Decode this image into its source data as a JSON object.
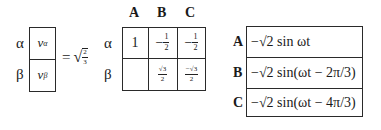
{
  "left_vector": {
    "row_labels": [
      "α",
      "β"
    ],
    "entries": [
      {
        "symbol": "v",
        "subscript": "α"
      },
      {
        "symbol": "v",
        "subscript": "β"
      }
    ]
  },
  "equals_sign": "=",
  "coefficient": {
    "radical": "√",
    "numerator": "2",
    "denominator": "3"
  },
  "transform_matrix": {
    "column_headers": [
      "A",
      "B",
      "C"
    ],
    "row_labels": [
      "α",
      "β"
    ],
    "rows": [
      [
        {
          "type": "text",
          "value": "1"
        },
        {
          "type": "frac",
          "sign": "−",
          "numerator": "1",
          "denominator": "2"
        },
        {
          "type": "frac",
          "sign": "−",
          "numerator": "1",
          "denominator": "2"
        }
      ],
      [
        {
          "type": "empty",
          "value": ""
        },
        {
          "type": "frac",
          "sign": "",
          "numerator": "√3",
          "denominator": "2"
        },
        {
          "type": "frac",
          "sign": "",
          "numerator": "−√3",
          "denominator": "2"
        }
      ]
    ]
  },
  "phase_vector": {
    "row_labels": [
      "A",
      "B",
      "C"
    ],
    "entries": [
      "−√2 sin ωt",
      "−√2 sin(ωt − 2π/3)",
      "−√2 sin(ωt − 4π/3)"
    ]
  }
}
